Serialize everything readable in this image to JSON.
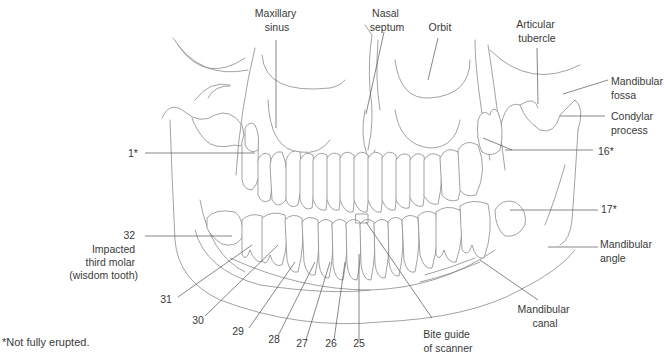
{
  "figure": {
    "type": "panoramic dental radiograph line drawing",
    "footnote": "*Not fully erupted."
  },
  "labels": {
    "maxillary_sinus": [
      "Maxillary",
      "sinus"
    ],
    "nasal_septum": [
      "Nasal",
      "septum"
    ],
    "orbit": [
      "Orbit"
    ],
    "articular_tubercle": [
      "Articular",
      "tubercle"
    ],
    "mandibular_fossa": [
      "Mandibular",
      "fossa"
    ],
    "condylar_process": [
      "Condylar",
      "process"
    ],
    "tooth_1": [
      "1*"
    ],
    "tooth_16": [
      "16*"
    ],
    "tooth_17": [
      "17*"
    ],
    "mandibular_angle": [
      "Mandibular",
      "angle"
    ],
    "mandibular_canal": [
      "Mandibular",
      "canal"
    ],
    "bite_guide": [
      "Bite guide",
      "of scanner"
    ],
    "tooth_32": [
      "32",
      "Impacted",
      "third molar",
      "(wisdom tooth)"
    ],
    "lower_teeth": [
      "31",
      "30",
      "29",
      "28",
      "27",
      "26",
      "25"
    ]
  },
  "colors": {
    "line": "#8a8a8a",
    "leader": "#555555",
    "text": "#3a3a3a",
    "background": "#ffffff"
  }
}
